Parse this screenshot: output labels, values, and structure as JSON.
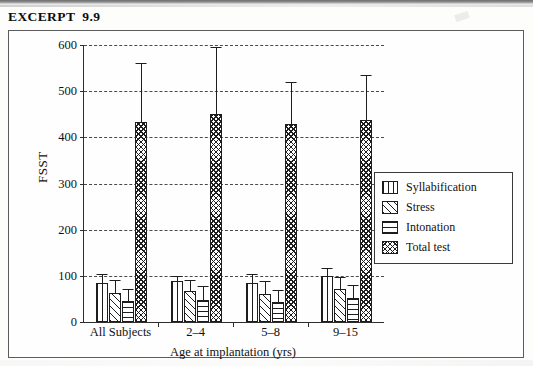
{
  "page": {
    "excerpt_label": "EXCERPT",
    "excerpt_number": "9.9"
  },
  "chart_data": {
    "type": "bar",
    "title": "",
    "subtitle": "",
    "xlabel": "Age at implantation (yrs)",
    "ylabel": "FSST",
    "ylim": [
      0,
      600
    ],
    "yticks": [
      0,
      100,
      200,
      300,
      400,
      500,
      600
    ],
    "ytick_labels": [
      "0",
      "100",
      "200",
      "300",
      "400",
      "500",
      "600"
    ],
    "grid": "horizontal-dashed",
    "legend_position": "right-middle",
    "categories": [
      "All Subjects",
      "2–4",
      "5–8",
      "9–15"
    ],
    "series": [
      {
        "name": "Syllabification",
        "pattern": "vertical-lines",
        "values": [
          85,
          88,
          85,
          100
        ],
        "errors_upper": [
          105,
          100,
          105,
          118
        ]
      },
      {
        "name": "Stress",
        "pattern": "diagonal-hatch",
        "values": [
          62,
          67,
          60,
          72
        ],
        "errors_upper": [
          90,
          90,
          88,
          98
        ]
      },
      {
        "name": "Intonation",
        "pattern": "horizontal-lines",
        "values": [
          45,
          48,
          43,
          52
        ],
        "errors_upper": [
          72,
          78,
          70,
          80
        ]
      },
      {
        "name": "Total test",
        "pattern": "checkerboard",
        "values": [
          433,
          450,
          428,
          437
        ],
        "errors_upper": [
          560,
          595,
          520,
          535
        ]
      }
    ],
    "legend_entries": [
      {
        "label": "Syllabification",
        "pattern": "vertical-lines"
      },
      {
        "label": "Stress",
        "pattern": "diagonal-hatch"
      },
      {
        "label": "Intonation",
        "pattern": "horizontal-lines"
      },
      {
        "label": "Total test",
        "pattern": "checkerboard"
      }
    ],
    "colors": {
      "ink": "#1d1d1d",
      "axis": "#2e2e2e",
      "grid": "#4a4a4a",
      "background": "#ffffff"
    }
  }
}
